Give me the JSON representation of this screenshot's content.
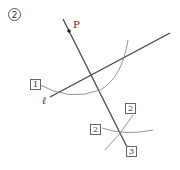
{
  "figure": {
    "step_number": "2",
    "point_label": "P",
    "line_label": "ℓ",
    "step_boxes": [
      {
        "label": "1"
      },
      {
        "label": "2"
      },
      {
        "label": "2"
      },
      {
        "label": "3"
      }
    ],
    "colors": {
      "line": "#444444",
      "arc": "#888888",
      "text": "#333333"
    }
  }
}
